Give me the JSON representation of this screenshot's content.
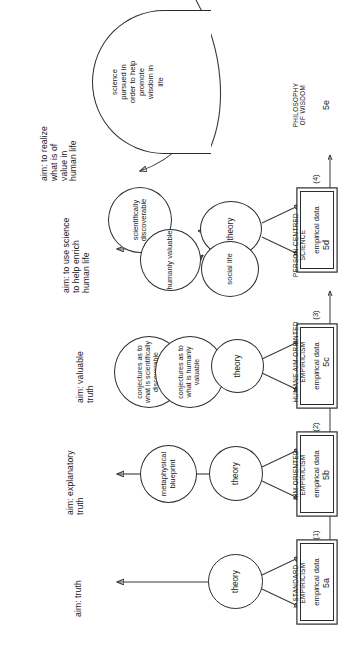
{
  "figure": {
    "orientation": "rotated-90-ccw",
    "caption": ""
  },
  "columns": [
    {
      "id": "5a",
      "stage_label": "STANDARD\nEMPIRICISM",
      "stage_number": "5a",
      "aim": "aim: truth",
      "nodes": {
        "theory": "theory",
        "empirical_data": "empirical\ndata"
      }
    },
    {
      "id": "5b",
      "stage_label": "AIM-ORIENTED\nEMPIRICISM",
      "stage_number": "5b",
      "aim": "aim: explanatory\ntruth",
      "nodes": {
        "blueprint": "metaphysical\nblueprint",
        "theory": "theory",
        "empirical_data": "empirical\ndata"
      }
    },
    {
      "id": "5c",
      "stage_label": "HUMANE AIM-ORIENTED\nEMPIRICISM",
      "stage_number": "5c",
      "aim": "aim: valuable\ntruth",
      "nodes": {
        "conj_sci": "conjectures as\nto what is\nscientifically\ndiscoverable",
        "conj_hum": "conjectures\nas to what\nis humanly\nvaluable",
        "theory": "theory",
        "empirical_data": "empirical\ndata"
      }
    },
    {
      "id": "5d",
      "stage_label": "PERSON-CENTRED\nSCIENCE",
      "stage_number": "5d",
      "aim": "aim: to use science\nto help enrich\nhuman life",
      "nodes": {
        "sci_disc": "scientifically\ndiscoverable",
        "hum_val": "humanly\nvaluable",
        "theory": "theory",
        "social_life": "social life",
        "empirical_data": "empirical\ndata"
      }
    },
    {
      "id": "5e",
      "stage_label": "PHILOSOPHY\nOF WISDOM",
      "stage_number": "5e",
      "aim": "aim: to realize\nwhat is of\nvalue in\nhuman life",
      "nodes": {
        "science_wisdom": "science\npursued in\norder to help\npromote\nwisdom in\nlife"
      }
    }
  ],
  "steps": [
    {
      "label": "(1)"
    },
    {
      "label": "(2)"
    },
    {
      "label": "(3)"
    },
    {
      "label": "(4)"
    }
  ],
  "colors": {
    "ink": "#2b2b2b",
    "line": "#3a3a3a",
    "background": "#ffffff"
  }
}
